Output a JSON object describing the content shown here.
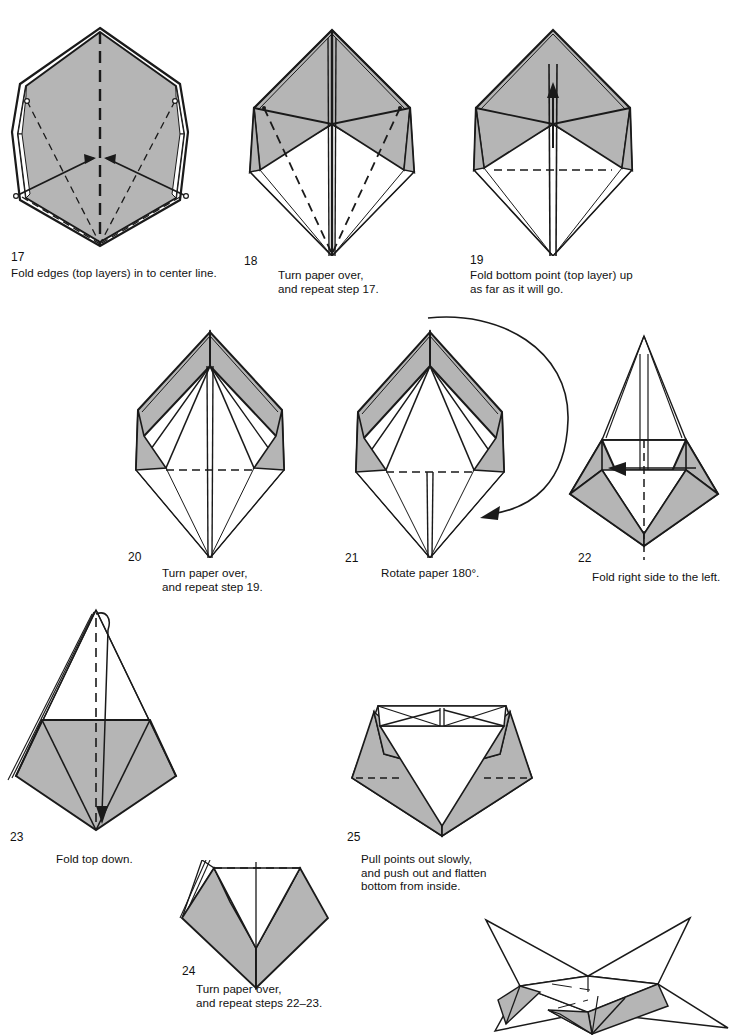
{
  "document": {
    "kind": "origami-instruction-diagram",
    "title": "Origami folding steps 17 through 25",
    "page_background": "#ffffff",
    "paper_front_color": "#b5b5b5",
    "paper_back_color": "#ffffff",
    "line_color": "#1a1a1a"
  },
  "steps": [
    {
      "number": "17",
      "caption": "Fold edges (top layers) in to center line.",
      "figure": "hexagon-with-center-arrows",
      "marks": [
        "vertical dashed center crease",
        "two solid arrows pointing inward to center",
        "dashed diagonal fold lines"
      ]
    },
    {
      "number": "18",
      "caption": "Turn paper over,\nand repeat step 17.",
      "figure": "kite-with-dashed-diagonals",
      "marks": [
        "dashed diagonal fold lines on both sides"
      ]
    },
    {
      "number": "19",
      "caption": "Fold bottom point (top layer) up\nas far as it will go.",
      "figure": "kite-with-up-arrow",
      "marks": [
        "horizontal dashed fold line",
        "upward solid arrow"
      ]
    },
    {
      "number": "20",
      "caption": "Turn paper over,\nand repeat step 19.",
      "figure": "narrow-kite-with-dashed-line",
      "marks": [
        "horizontal dashed fold line"
      ]
    },
    {
      "number": "21",
      "caption": "Rotate paper 180°.",
      "figure": "narrow-kite-with-rotation-arrow",
      "marks": [
        "horizontal dashed fold line",
        "large curved rotation arrow"
      ]
    },
    {
      "number": "22",
      "caption": "Fold right side to the left.",
      "figure": "inverted-kite-with-left-arrow",
      "marks": [
        "vertical dashed center line",
        "leftward solid arrow"
      ]
    },
    {
      "number": "23",
      "caption": "Fold top down.",
      "figure": "pentagon-with-down-arrow",
      "marks": [
        "horizontal dotted fold line",
        "vertical dashed crease",
        "downward hooked arrow"
      ]
    },
    {
      "number": "24",
      "caption": "Turn paper over,\nand repeat steps 22–23.",
      "figure": "tilted-v-shape",
      "marks": [
        "horizontal dashed fold line",
        "vertical center line"
      ]
    },
    {
      "number": "25",
      "caption": "Pull points out slowly,\nand push out and flatten\nbottom from inside.",
      "figure": "open-pentagon-with-flaps",
      "marks": [
        "two horizontal dashed fold lines",
        "top band with crossed lines"
      ]
    }
  ],
  "final_figure": {
    "name": "finished-star-box",
    "description": "Completed four-point star form shown in perspective"
  }
}
